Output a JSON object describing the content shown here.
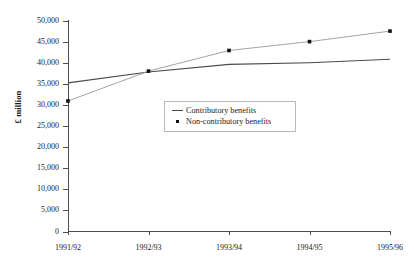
{
  "chart_data": {
    "type": "line",
    "title": "",
    "subtitle": "",
    "xlabel": "",
    "ylabel": "£ million",
    "categories": [
      "1991/92",
      "1992/93",
      "1993/94",
      "1994/95",
      "1995/96"
    ],
    "ylim": [
      0,
      50000
    ],
    "ytick_step": 5000,
    "ytick_labels": [
      "50,000",
      "45,000",
      "40,000",
      "35,000",
      "30,000",
      "25,000",
      "20,000",
      "15,000",
      "10,000",
      "5,000",
      "0"
    ],
    "ytick_values": [
      50000,
      45000,
      40000,
      35000,
      30000,
      25000,
      20000,
      15000,
      10000,
      5000,
      0
    ],
    "grid": false,
    "legend_position": "center",
    "series": [
      {
        "name": "Contributory benefits",
        "marker": "none",
        "color": "#4a4a4a",
        "values": [
          35300,
          37900,
          39700,
          40100,
          40900
        ]
      },
      {
        "name": "Non-contributory benefits",
        "marker": "square",
        "color": "#9a9a9a",
        "marker_color": "#111111",
        "values": [
          31000,
          38100,
          43000,
          45100,
          47600
        ]
      }
    ]
  },
  "legend": {
    "items": [
      {
        "label": "Contributory benefits",
        "key": "line-swatch",
        "color": "#4a4a4a"
      },
      {
        "label": "Non-contributory benefits",
        "key": "dot-swatch",
        "color": "#111111"
      }
    ]
  },
  "axis": {
    "y_title": "£ million"
  },
  "colors": {
    "axis": "#4d4d4d",
    "contributory": "#4a4a4a",
    "non_contributory": "#9a9a9a",
    "marker": "#111111",
    "legend_border": "#b9b9b9",
    "background": "#ffffff"
  }
}
